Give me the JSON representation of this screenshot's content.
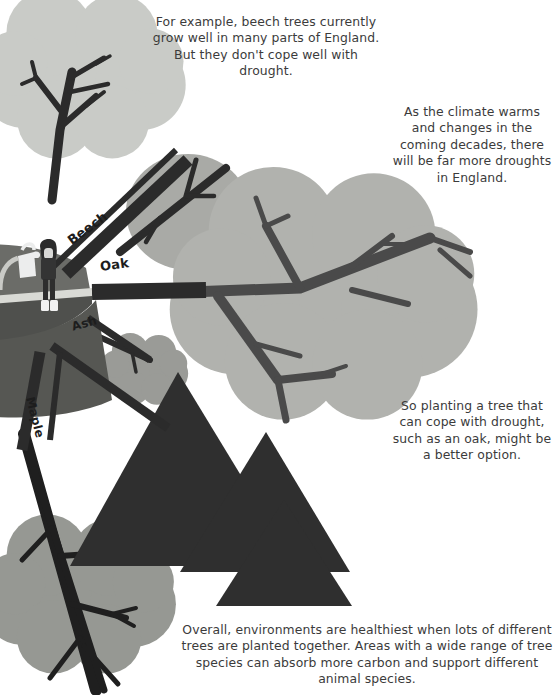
{
  "illustration": {
    "title": "Planting trees for a changing climate",
    "background_color": "#ffffff"
  },
  "captions": {
    "beech": "For example, beech trees currently grow well in many parts of England. But they don't cope well with drought.",
    "climate": "As the climate warms and changes in the coming decades, there will be far more droughts in England.",
    "oak": "So planting a tree that can cope with drought, such as an oak, might be a better option.",
    "overall": "Overall, environments are healthiest when lots of different trees are planted together. Areas with a wide range of tree species can absorb more carbon and support different animal species."
  },
  "tree_labels": {
    "beech": "Beech",
    "oak": "Oak",
    "ash": "Ash",
    "maple": "Maple"
  },
  "figure": {
    "name": "person-with-watering-can",
    "hair_color": "#2b2b2b",
    "top_color": "#343434",
    "trousers_color": "#2e2e2e",
    "boots_color": "#f2f2f2"
  },
  "palette": {
    "text": "#3b3b3b",
    "label_text": "#1d1d1d",
    "canopy_light": "#c9cbc7",
    "canopy_mid": "#b1b2ae",
    "canopy_dark": "#8e8f8b",
    "conifer": "#2f2f2f",
    "branch": "#2b2b2b",
    "mound": "#6b6c68",
    "mound_shadow": "#4f504d",
    "path": "#d9dad5"
  },
  "elements": {
    "canopies": [
      {
        "name": "beech-canopy",
        "shape": "cloud",
        "tone": "canopy_light"
      },
      {
        "name": "oak-canopy",
        "shape": "scalloped",
        "tone": "canopy_mid"
      },
      {
        "name": "ash-canopy",
        "shape": "cloud",
        "tone": "canopy_dark"
      },
      {
        "name": "maple-canopy",
        "shape": "scalloped",
        "tone": "canopy_dark"
      },
      {
        "name": "oval-canopy",
        "shape": "oval",
        "tone": "canopy_dark"
      }
    ],
    "conifers": [
      {
        "name": "conifer-large",
        "tone": "conifer"
      },
      {
        "name": "conifer-medium",
        "tone": "conifer"
      },
      {
        "name": "conifer-small",
        "tone": "conifer"
      }
    ]
  }
}
